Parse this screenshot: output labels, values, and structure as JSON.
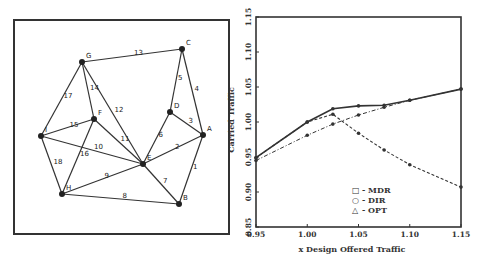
{
  "network": {
    "nodes": [
      {
        "id": "A",
        "x": 203,
        "y": 135
      },
      {
        "id": "B",
        "x": 179,
        "y": 204
      },
      {
        "id": "C",
        "x": 182,
        "y": 49
      },
      {
        "id": "D",
        "x": 170,
        "y": 112
      },
      {
        "id": "E",
        "x": 143,
        "y": 164
      },
      {
        "id": "F",
        "x": 94,
        "y": 119
      },
      {
        "id": "G",
        "x": 82,
        "y": 62
      },
      {
        "id": "H",
        "x": 62,
        "y": 194
      },
      {
        "id": "I",
        "x": 41,
        "y": 136
      }
    ],
    "edges": [
      {
        "label": "1",
        "from": "A",
        "to": "B"
      },
      {
        "label": "2",
        "from": "E",
        "to": "A"
      },
      {
        "label": "3",
        "from": "D",
        "to": "A"
      },
      {
        "label": "4",
        "from": "C",
        "to": "A"
      },
      {
        "label": "5",
        "from": "C",
        "to": "D"
      },
      {
        "label": "6",
        "from": "D",
        "to": "E"
      },
      {
        "label": "7",
        "from": "E",
        "to": "B"
      },
      {
        "label": "8",
        "from": "H",
        "to": "B"
      },
      {
        "label": "9",
        "from": "H",
        "to": "E"
      },
      {
        "label": "10",
        "from": "I",
        "to": "E"
      },
      {
        "label": "11",
        "from": "F",
        "to": "E"
      },
      {
        "label": "12",
        "from": "G",
        "to": "E"
      },
      {
        "label": "13",
        "from": "G",
        "to": "C"
      },
      {
        "label": "14",
        "from": "G",
        "to": "F"
      },
      {
        "label": "15",
        "from": "I",
        "to": "F"
      },
      {
        "label": "16",
        "from": "F",
        "to": "H"
      },
      {
        "label": "17",
        "from": "G",
        "to": "I"
      },
      {
        "label": "18",
        "from": "I",
        "to": "H"
      }
    ]
  },
  "chart_data": {
    "type": "line",
    "title": "",
    "xlabel": "x Design Offered Traffic",
    "ylabel": "Carried Traffic",
    "xlim": [
      0.95,
      1.15
    ],
    "ylim": [
      0.85,
      1.15
    ],
    "xticks": [
      "0.95",
      "1.00",
      "1.05",
      "1.10",
      "1.15"
    ],
    "yticks": [
      "0.85",
      "0.90",
      "0.95",
      "1.00",
      "1.05",
      "1.10",
      "1.15"
    ],
    "grid": false,
    "legend_position": "lower center",
    "x": [
      0.95,
      1.0,
      1.025,
      1.05,
      1.075,
      1.1,
      1.15
    ],
    "series": [
      {
        "name": "MDR",
        "marker": "square",
        "style": "dashed",
        "values": [
          0.949,
          1.0,
          1.011,
          0.984,
          0.96,
          0.939,
          0.907
        ]
      },
      {
        "name": "DIR",
        "marker": "circle",
        "style": "dashdot",
        "values": [
          0.945,
          0.981,
          0.997,
          1.01,
          1.021,
          1.031,
          1.047
        ]
      },
      {
        "name": "OPT",
        "marker": "triangle",
        "style": "solid",
        "values": [
          0.949,
          1.0,
          1.019,
          1.023,
          1.024,
          1.031,
          1.047
        ]
      }
    ],
    "legend": [
      {
        "symbol": "□",
        "label": "- MDR"
      },
      {
        "symbol": "○",
        "label": "- DIR"
      },
      {
        "symbol": "△",
        "label": "- OPT"
      }
    ]
  }
}
